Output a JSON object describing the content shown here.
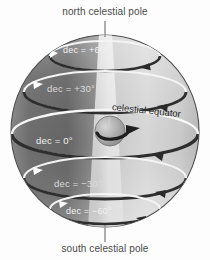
{
  "figure": {
    "title_alt": "celestial sphere with declination circles",
    "background_color": "#fdfdfd"
  },
  "poles": {
    "north_label": "north celestial pole",
    "south_label": "south celestial pole"
  },
  "equator": {
    "label": "celestial equator"
  },
  "declination_circles": [
    {
      "id": "dec-p60",
      "label": "dec = +60°",
      "value": 60
    },
    {
      "id": "dec-p30",
      "label": "dec = +30°",
      "value": 30
    },
    {
      "id": "dec-0",
      "label": "dec = 0°",
      "value": 0
    },
    {
      "id": "dec-m30",
      "label": "dec = −30°",
      "value": -30
    },
    {
      "id": "dec-m60",
      "label": "dec = −60°",
      "value": -60
    }
  ],
  "earth": {
    "rotation_arrow": "eastward rotation arrow"
  },
  "colors": {
    "sphere_dark": "#6b6b6b",
    "sphere_light": "#d8d8d8",
    "wedge_light": "#e9e9e9",
    "circle_line_light": "#ffffff",
    "circle_line_dark": "#3a3a3a",
    "label_dark": "#2c2c2c",
    "label_light": "#f2f2f2",
    "pole_label": "#4a4a4a"
  }
}
